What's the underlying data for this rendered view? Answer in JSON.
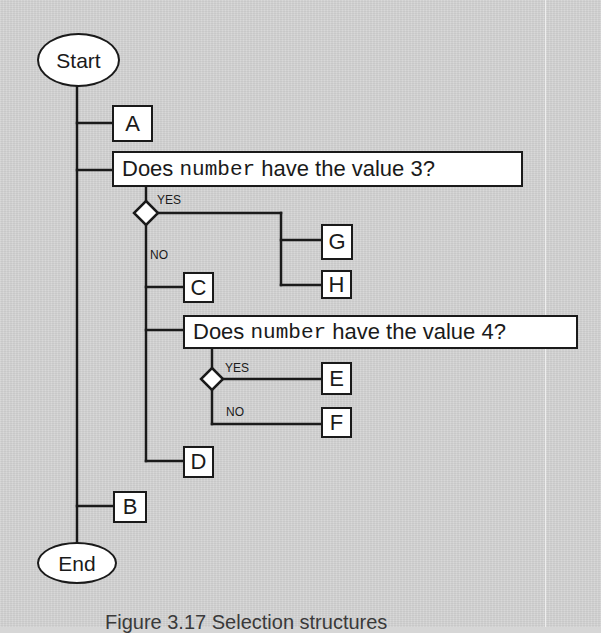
{
  "flowchart": {
    "start": {
      "label": "Start"
    },
    "end": {
      "label": "End"
    },
    "steps": {
      "A": "A",
      "B": "B",
      "C": "C",
      "D": "D",
      "E": "E",
      "F": "F",
      "G": "G",
      "H": "H"
    },
    "decision_1": {
      "prefix": "Does ",
      "variable": "number",
      "suffix": " have the value 3?",
      "yes_label": "YES",
      "no_label": "NO"
    },
    "decision_2": {
      "prefix": "Does ",
      "variable": "number",
      "suffix": " have the value 4?",
      "yes_label": "YES",
      "no_label": "NO"
    }
  },
  "caption": {
    "text": "Figure 3.17   Selection structures"
  },
  "colors": {
    "background": "#d5d5d5",
    "box_fill": "#ffffff",
    "stroke": "#1a1a1a"
  }
}
